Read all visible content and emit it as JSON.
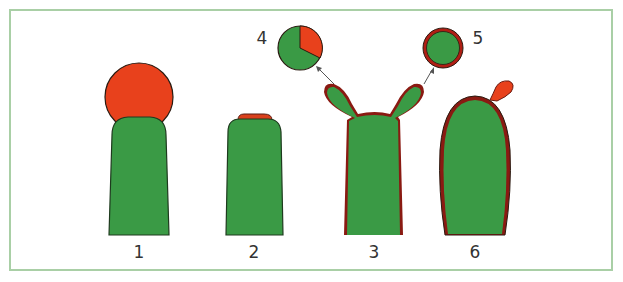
{
  "figure": {
    "colors": {
      "cell_green": "#3a9a45",
      "red": "#e8411c",
      "outline": "#2a1a10",
      "membrane_dark_red": "#8a1a12",
      "frame_border": "#a9cfa6",
      "label_text": "#333333"
    },
    "panels": [
      {
        "id": "1",
        "label": "1",
        "description": "green column with large red sphere on top"
      },
      {
        "id": "2",
        "label": "2",
        "description": "green column with thin red cap on top"
      },
      {
        "id": "3",
        "label": "3",
        "description": "green column with two lobes, red lining, arrows to insets 4 and 5"
      },
      {
        "id": "6",
        "label": "6",
        "description": "elongated green oval with red outline and small red bud at top right"
      }
    ],
    "insets": [
      {
        "id": "4",
        "label": "4",
        "description": "circle, mostly green with red sector (~1/3)"
      },
      {
        "id": "5",
        "label": "5",
        "description": "green circle with red ring outline"
      }
    ]
  },
  "caption": {
    "text": ""
  }
}
